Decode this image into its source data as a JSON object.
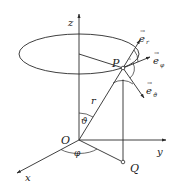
{
  "diagram": {
    "colors": {
      "stroke": "#2a2a2a",
      "text": "#1a1a1a",
      "background": "#ffffff"
    },
    "axes": {
      "z": {
        "label": "z"
      },
      "y": {
        "label": "y"
      },
      "x": {
        "label": "x"
      }
    },
    "points": {
      "origin": {
        "label": "O"
      },
      "P": {
        "label": "P"
      },
      "Q": {
        "label": "Q"
      }
    },
    "segments": {
      "radius": {
        "label": "r"
      }
    },
    "angles": {
      "theta": {
        "label": "ϑ"
      },
      "phi": {
        "label": "φ"
      }
    },
    "unit_vectors": {
      "e_r": {
        "base": "e",
        "sub": "r"
      },
      "e_phi": {
        "base": "e",
        "sub": "φ"
      },
      "e_theta": {
        "base": "e",
        "sub": "ϑ"
      }
    },
    "vector_arrow": "→"
  }
}
